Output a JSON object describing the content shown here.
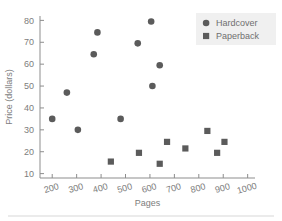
{
  "chart_data": {
    "type": "scatter",
    "title": "",
    "xlabel": "Pages",
    "ylabel": "Price (dollars)",
    "xlim": [
      150,
      1030
    ],
    "ylim": [
      8,
      82
    ],
    "xticks": [
      200,
      300,
      400,
      500,
      600,
      700,
      800,
      900,
      1000
    ],
    "xtick_labels": [
      "200",
      "300",
      "400",
      "500",
      "600",
      "700",
      "800",
      "900",
      "1000"
    ],
    "yticks": [
      10,
      20,
      30,
      40,
      50,
      60,
      70,
      80
    ],
    "ytick_labels": [
      "10",
      "20",
      "30",
      "40",
      "50",
      "60",
      "70",
      "80"
    ],
    "grid": false,
    "legend_position": "top-right",
    "series": [
      {
        "name": "Hardcover",
        "marker": "circle",
        "color": "#5b5b5b",
        "points": [
          {
            "x": 200,
            "y": 35.0
          },
          {
            "x": 260,
            "y": 47.0
          },
          {
            "x": 305,
            "y": 30.0
          },
          {
            "x": 370,
            "y": 64.5
          },
          {
            "x": 385,
            "y": 74.5
          },
          {
            "x": 480,
            "y": 35.0
          },
          {
            "x": 550,
            "y": 69.5
          },
          {
            "x": 605,
            "y": 79.5
          },
          {
            "x": 610,
            "y": 50.0
          },
          {
            "x": 640,
            "y": 59.5
          }
        ]
      },
      {
        "name": "Paperback",
        "marker": "square",
        "color": "#5b5b5b",
        "points": [
          {
            "x": 440,
            "y": 15.5
          },
          {
            "x": 555,
            "y": 19.5
          },
          {
            "x": 640,
            "y": 14.5
          },
          {
            "x": 670,
            "y": 24.5
          },
          {
            "x": 745,
            "y": 21.5
          },
          {
            "x": 835,
            "y": 29.5
          },
          {
            "x": 875,
            "y": 19.5
          },
          {
            "x": 905,
            "y": 24.5
          }
        ]
      }
    ]
  },
  "legend": {
    "entries": [
      {
        "label": "Hardcover",
        "marker": "circle"
      },
      {
        "label": "Paperback",
        "marker": "square"
      }
    ]
  },
  "colors": {
    "marker": "#5b5b5b",
    "axis": "#8d8d8d",
    "text": "#7d7d7d",
    "legend_background": "#f0f0f0",
    "page_background": "#ffffff",
    "rule": "#d8d8d8"
  }
}
